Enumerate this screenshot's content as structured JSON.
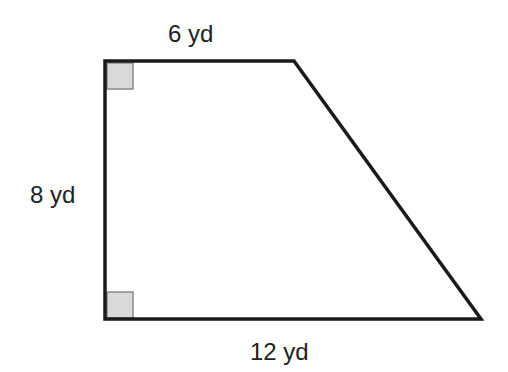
{
  "figure": {
    "shape": "right trapezoid",
    "labels": {
      "top": "6 yd",
      "left": "8 yd",
      "bottom": "12 yd"
    },
    "right_angle_markers": [
      "top-left",
      "bottom-left"
    ],
    "colors": {
      "stroke": "#1a1a1a",
      "marker_fill": "#d9d9d9",
      "marker_stroke": "#888888",
      "text": "#222222"
    }
  }
}
